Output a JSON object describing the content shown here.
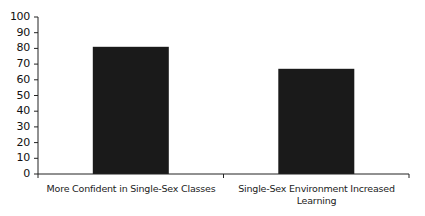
{
  "chart_data": {
    "type": "bar",
    "title": "",
    "xlabel": "",
    "ylabel": "",
    "categories": [
      "More Confident in Single-Sex Classes",
      "Single-Sex Environment Increased Learning"
    ],
    "values": [
      81,
      67
    ],
    "ylim": [
      0,
      100
    ],
    "yticks": [
      0,
      10,
      20,
      30,
      40,
      50,
      60,
      70,
      80,
      90,
      100
    ],
    "grid": false,
    "legend": null,
    "bar_color": "#1a1a1a"
  },
  "labels": {
    "yticks": [
      "0",
      "10",
      "20",
      "30",
      "40",
      "50",
      "60",
      "70",
      "80",
      "90",
      "100"
    ],
    "cat0_line1": "More Confident in Single-Sex Classes",
    "cat1_line1": "Single-Sex Environment Increased",
    "cat1_line2": "Learning"
  }
}
